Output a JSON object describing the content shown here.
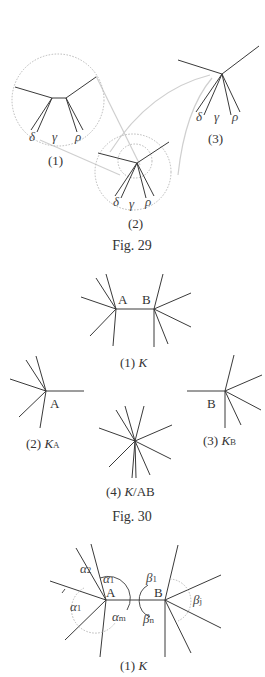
{
  "fig29": {
    "caption": "Fig. 29",
    "panels": [
      {
        "label": "(1)",
        "greek": [
          "δ",
          "γ",
          "ρ"
        ]
      },
      {
        "label": "(2)",
        "greek": [
          "δ",
          "γ",
          "ρ"
        ]
      },
      {
        "label": "(3)",
        "greek": [
          "δ",
          "γ",
          "ρ"
        ]
      }
    ]
  },
  "fig30": {
    "caption": "Fig. 30",
    "panels": [
      {
        "label_prefix": "(1) ",
        "label_var": "K",
        "vertices": [
          "A",
          "B"
        ]
      },
      {
        "label_prefix": "(2) ",
        "label_var": "K",
        "label_sub": "A",
        "vertex": "A"
      },
      {
        "label_prefix": "(3) ",
        "label_var": "K",
        "label_sub": "B",
        "vertex": "B"
      },
      {
        "label_prefix": "(4) ",
        "label_var": "K",
        "label_suffix": "/AB"
      }
    ]
  },
  "fig31": {
    "label_prefix": "(1) ",
    "label_var": "K",
    "vertices": [
      "A",
      "B"
    ],
    "angles": {
      "a2": {
        "sym": "α",
        "sub": "2"
      },
      "a1_top": {
        "sym": "α",
        "sub": "1"
      },
      "a1_left": {
        "sym": "α",
        "sub": "1"
      },
      "am": {
        "sym": "α",
        "sub": "m"
      },
      "b1": {
        "sym": "β",
        "sub": "1"
      },
      "bj": {
        "sym": "β",
        "sub": "j"
      },
      "bn": {
        "sym": "β",
        "sub": "n"
      }
    }
  }
}
